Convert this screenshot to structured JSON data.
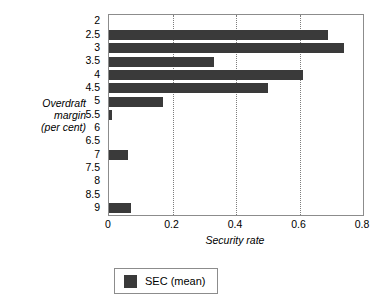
{
  "chart_data": {
    "type": "bar",
    "orientation": "horizontal",
    "title": "",
    "subtitle": "",
    "xlabel": "Security rate",
    "ylabel": "Overdraft margin (per cent)",
    "ylabel_lines": [
      "Overdraft",
      "margin",
      "(per cent)"
    ],
    "categories": [
      "2",
      "2.5",
      "3",
      "3.5",
      "4",
      "4.5",
      "5",
      "5.5",
      "6",
      "6.5",
      "7",
      "7.5",
      "8",
      "8.5",
      "9"
    ],
    "series": [
      {
        "name": "SEC (mean)",
        "color": "#3a3a3a",
        "values": [
          0,
          0.69,
          0.74,
          0.33,
          0.61,
          0.5,
          0.17,
          0.01,
          0,
          0,
          0.06,
          0,
          0,
          0,
          0.07
        ]
      }
    ],
    "xlim": [
      0,
      0.8
    ],
    "xticks": [
      0,
      0.2,
      0.4,
      0.6,
      0.8
    ],
    "xtick_labels": [
      "0",
      "0.2",
      "0.4",
      "0.6",
      "0.8"
    ],
    "gridlines": [
      0.2,
      0.4,
      0.6
    ],
    "grid": true,
    "grid_axis": "x",
    "grid_style": "dotted",
    "legend": {
      "position": "bottom",
      "entries": [
        {
          "label": "SEC (mean)",
          "color": "#3a3a3a"
        }
      ]
    },
    "plot_border_color": "#8c8c8c",
    "background": "#ffffff"
  }
}
